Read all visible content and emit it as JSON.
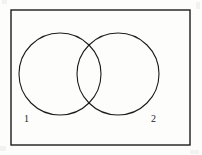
{
  "figure": {
    "kind": "venn-diagram",
    "background_color": "#fdfdfc",
    "stroke_color": "#1c1c1c",
    "frame": {
      "name": "universal-set-rectangle",
      "x": 11,
      "y": 10,
      "width": 179,
      "height": 135,
      "stroke_width": 1.4
    },
    "circles": [
      {
        "label": "1",
        "name": "set-circle-1",
        "cx": 60,
        "cy": 74,
        "r": 41,
        "stroke_width": 1.1
      },
      {
        "label": "2",
        "name": "set-circle-2",
        "cx": 118,
        "cy": 74,
        "r": 41,
        "stroke_width": 1.1
      }
    ],
    "labels": [
      {
        "text": "1",
        "name": "set-label-1",
        "x": 24,
        "y": 122,
        "font_size": 10
      },
      {
        "text": "2",
        "name": "set-label-2",
        "x": 151,
        "y": 122,
        "font_size": 10
      }
    ]
  }
}
